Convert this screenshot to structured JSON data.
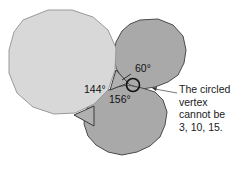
{
  "diagram": {
    "polygons": [
      {
        "name": "decagon",
        "sides": 10,
        "interior_angle": "144°",
        "fill": "#d8d8d8",
        "stroke": "#9a9a9a"
      },
      {
        "name": "15-gon",
        "sides": 15,
        "interior_angle": "156°",
        "fill": "#a9a9a9",
        "stroke": "#4a4a4a"
      },
      {
        "name": "triangle",
        "sides": 3,
        "interior_angle": "60°",
        "fill": "#b0b0b0",
        "stroke": "#3a3a3a"
      }
    ],
    "labels": {
      "angle_60": "60°",
      "angle_144": "144°",
      "angle_156": "156°"
    },
    "annotation": {
      "lines": [
        "The circled",
        "vertex",
        "cannot be",
        "3, 10, 15."
      ]
    }
  }
}
